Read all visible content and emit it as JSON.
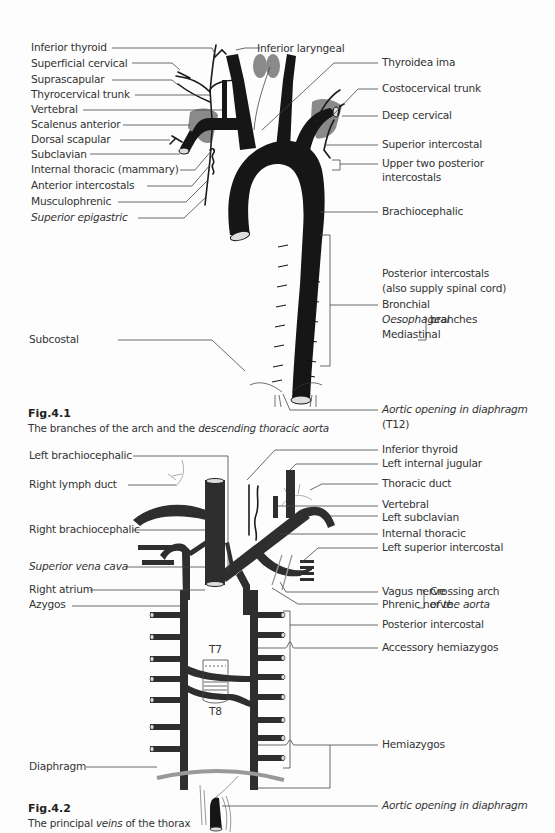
{
  "fig1": {
    "left_labels": [
      "Inferior thyroid",
      "Superficial cervical",
      "Suprascapular",
      "Thyrocervical trunk",
      "Vertebral",
      "Scalenus anterior",
      "Dorsal scapular",
      "Subclavian",
      "Internal thoracic (mammary)",
      "Anterior intercostals",
      "Musculophrenic",
      "Superior epigastric"
    ],
    "top_label": "Inferior laryngeal",
    "right_labels": {
      "thyroidea_ima": "Thyroidea ima",
      "costocervical": "Costocervical trunk",
      "deep_cervical": "Deep cervical",
      "superior_intercostal": "Superior intercostal",
      "upper_two_1": "Upper two posterior",
      "upper_two_2": "intercostals",
      "brachiocephalic": "Brachiocephalic",
      "posterior_intercostals": "Posterior intercostals",
      "spinal_cord": "(also supply spinal cord)",
      "bronchial": "Bronchial",
      "oesophageal": "Oesophageal",
      "mediastinal": "Mediastinal",
      "branches": "branches",
      "aortic_opening": "Aortic opening in diaphragm",
      "t12": "(T12)"
    },
    "subcostal": "Subcostal",
    "caption_title": "Fig.4.1",
    "caption_text_plain": "The branches of the arch and the ",
    "caption_text_italic": "descending thoracic aorta"
  },
  "fig2": {
    "left_labels": {
      "left_brachiocephalic": "Left brachiocephalic",
      "right_lymph_duct": "Right lymph duct",
      "right_brachiocephalic": "Right brachiocephalic",
      "svc": "Superior vena cava",
      "right_atrium": "Right atrium",
      "azygos": "Azygos",
      "diaphragm": "Diaphragm"
    },
    "right_labels": {
      "inferior_thyroid": "Inferior thyroid",
      "left_internal_jugular": "Left internal jugular",
      "thoracic_duct": "Thoracic duct",
      "vertebral": "Vertebral",
      "left_subclavian": "Left subclavian",
      "internal_thoracic": "Internal thoracic",
      "left_superior_intercostal": "Left superior intercostal",
      "vagus": "Vagus nerve",
      "phrenic": "Phrenic nerve",
      "crossing_1": "Crossing arch",
      "crossing_2": "of the aorta",
      "posterior_intercostal": "Posterior intercostal",
      "accessory_hemiazygos": "Accessory hemiazygos",
      "hemiazygos": "Hemiazygos",
      "aortic_opening": "Aortic opening in diaphragm"
    },
    "vertebra_labels": [
      "T7",
      "T8"
    ],
    "caption_title": "Fig.4.2",
    "caption_text_plain": "The principal ",
    "caption_text_italic": "veins",
    "caption_text_end": " of the thorax"
  }
}
